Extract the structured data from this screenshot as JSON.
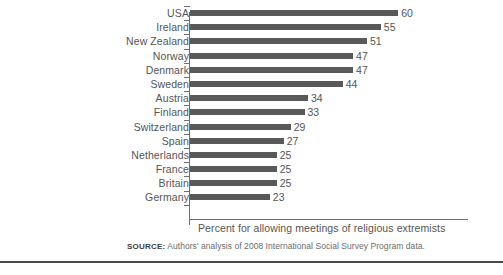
{
  "chart_data": {
    "type": "bar",
    "orientation": "horizontal",
    "title": "",
    "xlabel": "Percent for allowing meetings of religious extremists",
    "ylabel": "",
    "xlim": [
      0,
      60
    ],
    "grid": false,
    "legend": false,
    "categories": [
      "USA",
      "Ireland",
      "New Zealand",
      "Norway",
      "Denmark",
      "Sweden",
      "Austria",
      "Finland",
      "Switzerland",
      "Spain",
      "Netherlands",
      "France",
      "Britain",
      "Germany"
    ],
    "values": [
      60,
      55,
      51,
      47,
      47,
      44,
      34,
      33,
      29,
      27,
      25,
      25,
      25,
      23
    ],
    "bar_color": "#595959",
    "axis_color": "#6f6f6f",
    "text_color": "#555555"
  },
  "axis": {
    "label": "Percent for allowing meetings of religious extremists"
  },
  "source": {
    "label": "SOURCE:",
    "text": "Authors' analysis of 2008 International Social Survey Program data."
  }
}
